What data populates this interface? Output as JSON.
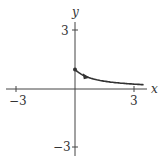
{
  "chart_data": {
    "type": "line",
    "title": "",
    "xlabel": "x",
    "ylabel": "y",
    "xlim": [
      -3.2,
      3.6
    ],
    "ylim": [
      -3.3,
      3.5
    ],
    "x_ticks": [
      -3,
      3
    ],
    "y_ticks": [
      3,
      -3
    ],
    "x_tick_labels": [
      "−3",
      "3"
    ],
    "y_tick_labels": [
      "3",
      "−3"
    ],
    "grid": false,
    "series": [
      {
        "name": "parametric curve",
        "x": [
          0,
          0.25,
          0.5,
          0.75,
          1,
          1.5,
          2,
          2.5,
          3,
          3.5
        ],
        "y": [
          1,
          0.8,
          0.67,
          0.57,
          0.5,
          0.4,
          0.33,
          0.29,
          0.25,
          0.22
        ],
        "start_point": [
          0,
          1
        ],
        "direction_arrow_at": [
          0.55,
          0.65
        ]
      }
    ],
    "color": "#333333"
  },
  "labels": {
    "x_axis": "x",
    "y_axis": "y",
    "x_neg": "−3",
    "x_pos": "3",
    "y_pos": "3",
    "y_neg": "−3"
  }
}
